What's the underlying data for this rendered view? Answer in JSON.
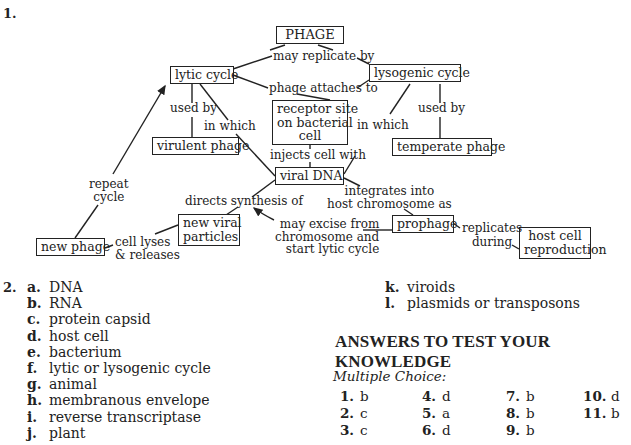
{
  "question_1": {
    "number": "1.",
    "concept_map": {
      "nodes": {
        "phage": "PHAGE",
        "lytic_cycle": "lytic cycle",
        "lysogenic_cycle": "lysogenic cycle",
        "receptor_site": [
          "receptor site",
          "on bacterial",
          "cell"
        ],
        "virulent_phage": "virulent phage",
        "temperate_phage": "temperate phage",
        "viral_dna": "viral DNA",
        "new_viral_particles": [
          "new viral",
          "particles"
        ],
        "new_phage": "new phage",
        "prophage": "prophage",
        "host_cell_reproduction": [
          "host cell",
          "reproduction"
        ]
      },
      "links": {
        "may_replicate_by": "may replicate by",
        "phage_attaches_to": "phage attaches to",
        "used_by_lytic": "used by",
        "used_by_lysogenic": "used by",
        "in_which_lytic": "in which",
        "in_which_lysogenic": "in which",
        "injects_cell_with": "injects cell with",
        "directs_synthesis_of": "directs synthesis of",
        "integrates_into": [
          "integrates into",
          "host chromosome as"
        ],
        "may_excise": [
          "may excise from",
          "chromosome and",
          "start lytic cycle"
        ],
        "replicates_during": [
          "replicates",
          "during"
        ],
        "cell_lyses": [
          "cell lyses",
          "& releases"
        ],
        "repeat_cycle": [
          "repeat",
          "cycle"
        ]
      }
    }
  },
  "question_2": {
    "number": "2.",
    "items": [
      {
        "key": "a.",
        "text": "DNA"
      },
      {
        "key": "b.",
        "text": "RNA"
      },
      {
        "key": "c.",
        "text": "protein capsid"
      },
      {
        "key": "d.",
        "text": "host cell"
      },
      {
        "key": "e.",
        "text": "bacterium"
      },
      {
        "key": "f.",
        "text": "lytic or lysogenic cycle"
      },
      {
        "key": "g.",
        "text": "animal"
      },
      {
        "key": "h.",
        "text": "membranous envelope"
      },
      {
        "key": "i.",
        "text": "reverse transcriptase"
      },
      {
        "key": "j.",
        "text": "plant"
      },
      {
        "key": "k.",
        "text": "viroids"
      },
      {
        "key": "l.",
        "text": "plasmids or transposons"
      }
    ]
  },
  "answers": {
    "heading": "ANSWERS TO TEST YOUR KNOWLEDGE",
    "subheading": "Multiple Choice:",
    "multiple_choice": [
      {
        "n": "1.",
        "a": "b"
      },
      {
        "n": "2.",
        "a": "c"
      },
      {
        "n": "3.",
        "a": "c"
      },
      {
        "n": "4.",
        "a": "d"
      },
      {
        "n": "5.",
        "a": "a"
      },
      {
        "n": "6.",
        "a": "d"
      },
      {
        "n": "7.",
        "a": "b"
      },
      {
        "n": "8.",
        "a": "b"
      },
      {
        "n": "9.",
        "a": "b"
      },
      {
        "n": "10.",
        "a": "d"
      },
      {
        "n": "11.",
        "a": "b"
      }
    ]
  }
}
